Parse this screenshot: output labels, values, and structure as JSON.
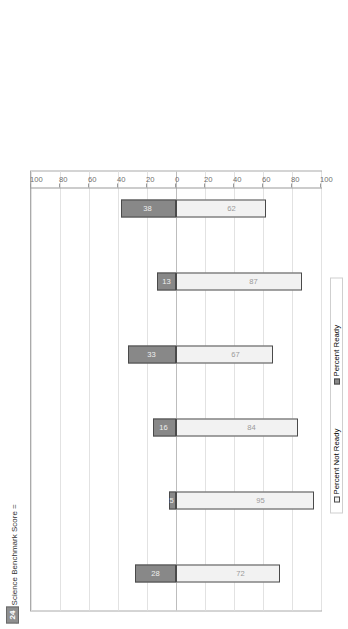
{
  "figure": {
    "benchmark_label": "ACT Science Benchmark Score =",
    "benchmark_value": "24"
  },
  "chart_data": {
    "type": "bar",
    "orientation": "horizontal-stacked-diverging",
    "title": "",
    "xlabel": "",
    "ylabel": "",
    "axis_ticks": [
      "100",
      "80",
      "60",
      "40",
      "20",
      "0",
      "20",
      "40",
      "60",
      "80",
      "100"
    ],
    "axis_range": [
      -100,
      100
    ],
    "grid": true,
    "legend_position": "bottom",
    "categories": [
      "All Students",
      "African Am./Black",
      "Am. Indian/Alaska Native",
      "Caucasian Am./White",
      "Hispanic",
      "Asian Am./Pacific Islander"
    ],
    "series": [
      {
        "name": "Percent Not Ready",
        "values": [
          72,
          95,
          84,
          67,
          87,
          62
        ]
      },
      {
        "name": "Percent Ready",
        "values": [
          28,
          5,
          16,
          33,
          13,
          38
        ]
      }
    ],
    "groups": [
      {
        "name": "All Students",
        "n_label": "N =  1,421,941",
        "ready_label": "% ready = 28",
        "not_ready": 72,
        "ready": 28
      },
      {
        "name": "African Am./Black",
        "n_label": "N =  178,417",
        "ready_label": "% ready = 5",
        "not_ready": 95,
        "ready": 5
      },
      {
        "name": "Am. Indian/Alaska Native",
        "n_label": "N =  14,380",
        "ready_label": "% ready = 16",
        "not_ready": 84,
        "ready": 16
      },
      {
        "name": "Caucasian Am./White",
        "n_label": "N =  895,588",
        "ready_label": "% ready = 33",
        "not_ready": 67,
        "ready": 33
      },
      {
        "name": "Hispanic",
        "n_label": "N =  114,697",
        "ready_label": "% ready = 13",
        "not_ready": 87,
        "ready": 13
      },
      {
        "name": "Asian Am./Pacific Islander",
        "n_label": "N =  51,368",
        "ready_label": "% ready = 38",
        "not_ready": 62,
        "ready": 38
      }
    ]
  },
  "legend": {
    "not_ready": "Percent Not Ready",
    "ready": "Percent Ready"
  },
  "colors": {
    "ready_fill": "#888888",
    "not_ready_fill": "#f2f2f2",
    "bar_stroke": "#4a4a4a",
    "grid": "#e2e2e2",
    "axis": "#9a9a9a",
    "callout_bg": "#8f8f8f"
  }
}
